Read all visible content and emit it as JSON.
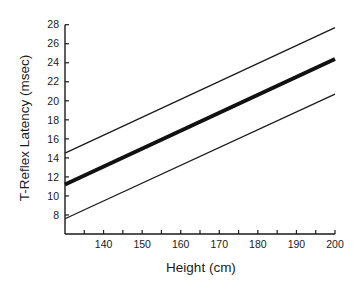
{
  "chart_data": {
    "type": "line",
    "title": "",
    "xlabel": "Height (cm)",
    "ylabel": "T-Reflex Latency (msec)",
    "xlim": [
      130,
      200
    ],
    "ylim": [
      6,
      28
    ],
    "x_ticks": [
      135,
      140,
      145,
      150,
      155,
      160,
      165,
      170,
      175,
      180,
      185,
      190,
      195,
      200
    ],
    "x_tick_labels": [
      "140",
      "150",
      "160",
      "170",
      "180",
      "190",
      "200"
    ],
    "x_tick_label_values": [
      140,
      150,
      160,
      170,
      180,
      190,
      200
    ],
    "y_ticks": [
      8,
      10,
      12,
      14,
      16,
      18,
      20,
      22,
      24,
      26,
      28
    ],
    "y_tick_labels": [
      "8",
      "10",
      "12",
      "14",
      "16",
      "18",
      "20",
      "22",
      "24",
      "26",
      "28"
    ],
    "grid": false,
    "legend": null,
    "x": [
      130,
      200
    ],
    "series": [
      {
        "name": "Upper limit",
        "values": [
          14.5,
          27.7
        ],
        "style": "thin",
        "color": "#1a1a1a"
      },
      {
        "name": "Mean (regression line)",
        "values": [
          11.2,
          24.4
        ],
        "style": "thick",
        "color": "#111111"
      },
      {
        "name": "Lower limit",
        "values": [
          7.6,
          20.7
        ],
        "style": "thin",
        "color": "#1a1a1a"
      }
    ]
  },
  "plot": {
    "left": 65,
    "right": 335,
    "top": 24.7,
    "bottom": 234,
    "y_at_top": 28,
    "y_at_bottom": 6
  }
}
